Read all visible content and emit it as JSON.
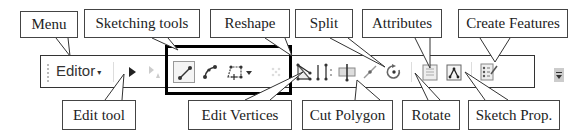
{
  "toolbar": {
    "menu_label": "Editor",
    "menu_caret": "▾",
    "tools": [
      {
        "id": "edit-tool",
        "icon": "arrow-pointer-icon"
      },
      {
        "id": "annotation-edit-tool",
        "icon": "annotation-arrow-icon",
        "disabled": true
      },
      {
        "id": "straight-segment",
        "icon": "straight-segment-icon",
        "selected": true
      },
      {
        "id": "end-point-arc",
        "icon": "arc-segment-icon"
      },
      {
        "id": "construction-tools",
        "icon": "polygon-construct-icon",
        "has_dropdown": true
      },
      {
        "id": "edit-vertices",
        "icon": "edit-vertices-icon",
        "disabled": true
      },
      {
        "id": "reshape",
        "icon": "reshape-icon"
      },
      {
        "id": "cut-polygon",
        "icon": "cut-polygon-icon"
      },
      {
        "id": "split",
        "icon": "split-icon"
      },
      {
        "id": "rotate",
        "icon": "rotate-icon"
      },
      {
        "id": "attributes",
        "icon": "attributes-icon"
      },
      {
        "id": "sketch-properties",
        "icon": "sketch-properties-icon"
      },
      {
        "id": "create-features",
        "icon": "create-features-icon"
      }
    ]
  },
  "callouts": {
    "top": [
      {
        "label": "Menu"
      },
      {
        "label": "Sketching tools"
      },
      {
        "label": "Reshape"
      },
      {
        "label": "Split"
      },
      {
        "label": "Attributes"
      },
      {
        "label": "Create Features"
      }
    ],
    "bottom": [
      {
        "label": "Edit tool"
      },
      {
        "label": "Edit Vertices"
      },
      {
        "label": "Cut Polygon"
      },
      {
        "label": "Rotate"
      },
      {
        "label": "Sketch Prop."
      }
    ]
  }
}
